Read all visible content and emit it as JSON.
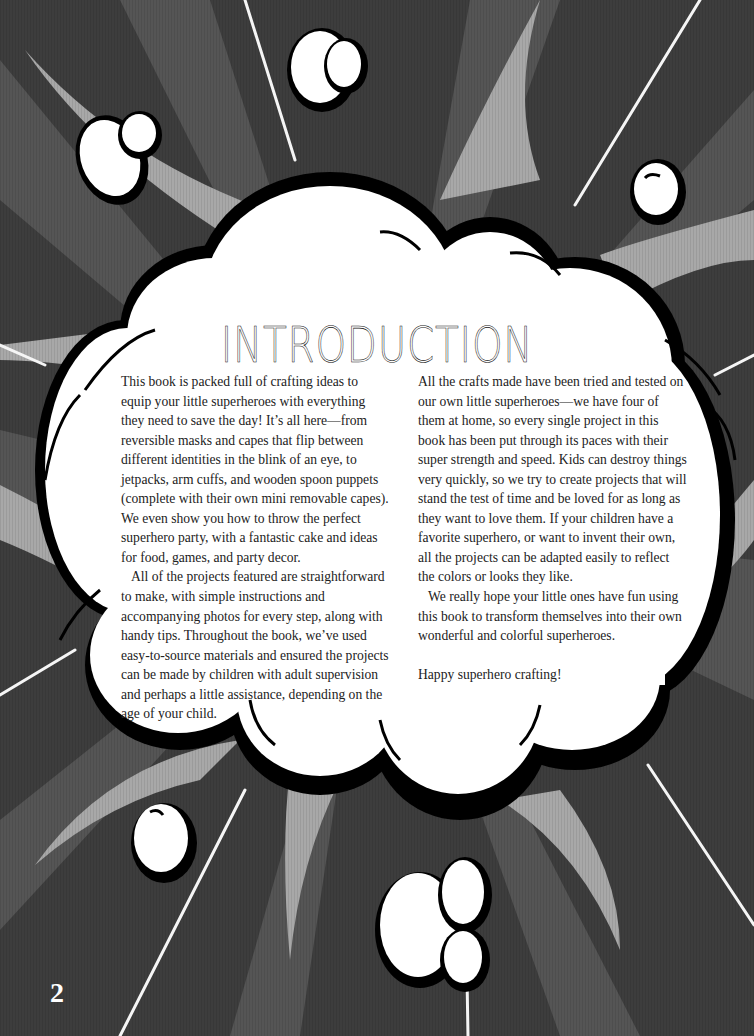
{
  "page": {
    "title": "INTRODUCTION",
    "page_number": "2",
    "colors": {
      "background_dark": "#3b3b3b",
      "ray_light": "#a9a9a9",
      "ray_mid": "#555555",
      "cloud_fill": "#ffffff",
      "cloud_outline": "#000000",
      "text": "#222222"
    },
    "left_column": {
      "paragraphs": [
        "This book is packed full of crafting ideas to equip your little superheroes with everything they need to save the day! It’s all here—from reversible masks and capes that flip between different identities in the blink of an eye, to jetpacks, arm cuffs, and wooden spoon puppets (complete with their own mini removable capes). We even show you how to throw the perfect superhero party, with a fantastic cake and ideas for food, games, and party decor.",
        "All of the projects featured are straightforward to make, with simple instructions and accompanying photos for every step, along with handy tips. Throughout the book, we’ve used easy-to-source materials and ensured the projects can be made by children with adult supervision and perhaps a little assistance, depending on the age of your child."
      ]
    },
    "right_column": {
      "paragraphs": [
        "All the crafts made have been tried and tested on our own little superheroes—we have four of them at home, so every single project in this book has been put through its paces with their super strength and speed. Kids can destroy things very quickly, so we try to create projects that will stand the test of time and be loved for as long as they want to love them. If your children have a favorite superhero, or want to invent their own, all the projects can be adapted easily to reflect the colors or looks they like.",
        "We really hope your little ones have fun using this book to transform themselves into their own wonderful and colorful superheroes.",
        "Happy superhero crafting!"
      ]
    },
    "decorations": {
      "background": "comic-burst-rays",
      "main_bubble": "cloud-speech-bubble",
      "small_clouds": [
        "small-cloud-top-left",
        "small-cloud-top-center",
        "small-cloud-top-right",
        "small-cloud-bottom-left",
        "small-cloud-bottom-center"
      ]
    }
  }
}
